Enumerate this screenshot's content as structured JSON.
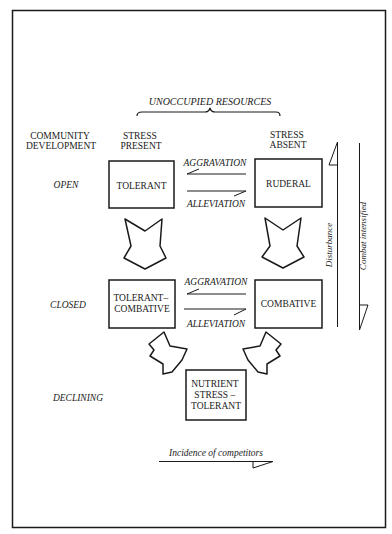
{
  "header": {
    "resources": "UNOCCUPIED RESOURCES"
  },
  "columns": {
    "community_line1": "COMMUNITY",
    "community_line2": "DEVELOPMENT",
    "stress_present_line1": "STRESS",
    "stress_present_line2": "PRESENT",
    "stress_absent_line1": "STRESS",
    "stress_absent_line2": "ABSENT"
  },
  "rows": {
    "open": "OPEN",
    "closed": "CLOSED",
    "declining": "DECLINING"
  },
  "boxes": {
    "tolerant": "TOLERANT",
    "ruderal": "RUDERAL",
    "tolerant_combative_line1": "TOLERANT–",
    "tolerant_combative_line2": "COMBATIVE",
    "combative": "COMBATIVE",
    "nst_line1": "NUTRIENT",
    "nst_line2": "STRESS –",
    "nst_line3": "TOLERANT"
  },
  "transitions": {
    "aggravation_top": "AGGRAVATION",
    "alleviation_top": "ALLEVIATION",
    "aggravation_bottom": "AGGRAVATION",
    "alleviation_bottom": "ALLEVIATION"
  },
  "axes": {
    "disturbance": "Disturbance",
    "combat": "Combat intensified",
    "competitors": "Incidence of competitors"
  },
  "colors": {
    "ink": "#1a1a1a",
    "background": "#ffffff"
  }
}
